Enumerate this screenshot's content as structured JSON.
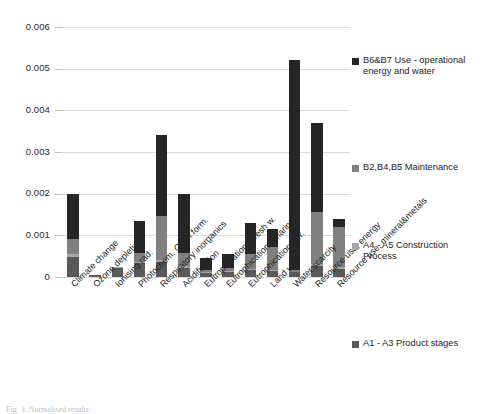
{
  "chart_data": {
    "type": "bar",
    "title": "",
    "subtitle": "",
    "xlabel": "",
    "ylabel": "",
    "stacked": true,
    "grid": true,
    "legend_position": "right",
    "ylim": [
      0,
      0.006
    ],
    "ytick_labels": [
      "0",
      "0.001",
      "0.002",
      "0.003",
      "0.004",
      "0.005",
      "0.006"
    ],
    "ytick_values": [
      0,
      0.001,
      0.002,
      0.003,
      0.004,
      0.005,
      0.006
    ],
    "categories": [
      "Climate change",
      "Ozone depletion",
      "Ionising rad.",
      "Photochem. Ozon form.",
      "Respiratory inorganics",
      "Acidification",
      "Eutrophication - fresh w.",
      "Eutrophication - marine",
      "Eutrophication terr.",
      "Land use",
      "Water scarcity",
      "Resource use, energy",
      "Resource use, mineral&metals"
    ],
    "series": [
      {
        "name": "A1 - A3 Product stages",
        "color": "#595959",
        "values": [
          0.00048,
          4e-05,
          0.00022,
          0.00033,
          0.00035,
          0.00022,
          9e-05,
          0.00012,
          0.00016,
          0.00015,
          0.00011,
          0.00027,
          0.0002
        ]
      },
      {
        "name": "A4 - A5 Construction Process",
        "color": "#a6a6a6",
        "values": [
          8e-05,
          5e-06,
          1e-05,
          4e-05,
          6e-05,
          5e-05,
          2e-05,
          2e-05,
          3e-05,
          3e-05,
          2e-05,
          5e-05,
          4e-05
        ]
      },
      {
        "name": "B2,B4,B5 Maintenance",
        "color": "#808080",
        "values": [
          0.00035,
          5e-06,
          2e-05,
          0.0002,
          0.00105,
          0.00031,
          5e-05,
          7e-05,
          0.00036,
          0.00053,
          3e-05,
          0.00125,
          0.00097
        ]
      },
      {
        "name": "B6&B7 Use - operational energy and water",
        "color": "#262626",
        "values": [
          0.00109,
          0.0,
          0.0,
          0.00078,
          0.00194,
          0.00142,
          0.00029,
          0.00034,
          0.00075,
          0.00044,
          0.00504,
          0.00213,
          0.00019
        ]
      }
    ],
    "totals": [
      0.002,
      5e-05,
      0.00025,
      0.00135,
      0.0034,
      0.002,
      0.00045,
      0.00055,
      0.0013,
      0.00115,
      0.0052,
      0.0037,
      0.0014
    ]
  },
  "legend": {
    "items": [
      {
        "label": "B6&B7 Use - operational energy and water",
        "color": "#262626"
      },
      {
        "label": "B2,B4,B5 Maintenance",
        "color": "#808080"
      },
      {
        "label": "A4 - A5 Construction Process",
        "color": "#a6a6a6"
      },
      {
        "label": "A1 - A3 Product stages",
        "color": "#595959"
      }
    ]
  },
  "caption": {
    "text": "Fig. 3. Normalised results"
  }
}
